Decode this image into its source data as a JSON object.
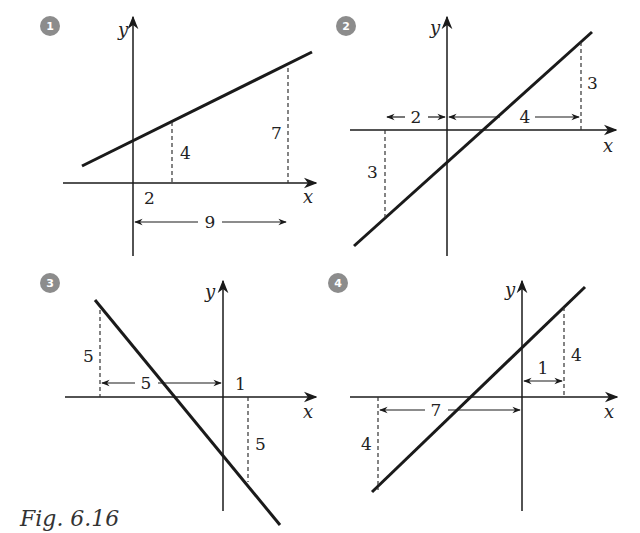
{
  "figure": {
    "caption": "Fig. 6.16",
    "colors": {
      "line": "#1a1a1a",
      "badge": "#8c8c8c",
      "text": "#222222"
    },
    "panels": [
      {
        "number": "1",
        "axis_x": "x",
        "axis_y": "y",
        "description": "Line with positive slope, crossing y-axis above origin",
        "labels": {
          "x_offset": "2",
          "height_a": "4",
          "height_b": "7",
          "horizontal_span": "9"
        }
      },
      {
        "number": "2",
        "axis_x": "x",
        "axis_y": "y",
        "description": "Line with positive slope, crossing y-axis below origin",
        "labels": {
          "height_left": "3",
          "height_right": "3",
          "span_left": "2",
          "span_right": "4"
        }
      },
      {
        "number": "3",
        "axis_x": "x",
        "axis_y": "y",
        "description": "Line with negative slope, crossing y-axis below origin",
        "labels": {
          "height_left": "5",
          "height_right": "5",
          "span_left": "5",
          "x_right": "1"
        }
      },
      {
        "number": "4",
        "axis_x": "x",
        "axis_y": "y",
        "description": "Line with positive slope, crossing y-axis above origin",
        "labels": {
          "height_right": "4",
          "height_left": "4",
          "span_left": "7",
          "span_right": "1"
        }
      }
    ]
  }
}
